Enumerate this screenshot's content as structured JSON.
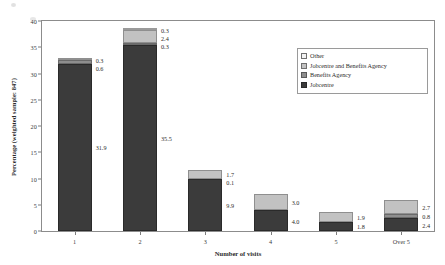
{
  "chart_data": {
    "type": "bar",
    "stacked": true,
    "title": "",
    "xlabel": "Number of visits",
    "ylabel": "Percentage (weighted sample: 847)",
    "categories": [
      "1",
      "2",
      "3",
      "4",
      "5",
      "Over 5"
    ],
    "ylim": [
      0,
      40
    ],
    "yticks": [
      0,
      5,
      10,
      15,
      20,
      25,
      30,
      35,
      40
    ],
    "grid": false,
    "legend_position": "upper-right-inside",
    "series": [
      {
        "name": "Jobcentre",
        "color": "#3b3b3b",
        "values": [
          31.9,
          35.5,
          9.9,
          4.0,
          1.8,
          2.4
        ],
        "labels": [
          "31.9",
          "35.5",
          "9.9",
          "4.0",
          "1.8",
          "2.4"
        ]
      },
      {
        "name": "Benefits Agency",
        "color": "#8e8e8e",
        "values": [
          0.6,
          0.3,
          0.1,
          0.0,
          0.0,
          0.8
        ],
        "labels": [
          "0.6",
          "0.3",
          "0.1",
          "",
          "",
          "0.8"
        ]
      },
      {
        "name": "Jobcentre and Benefits Agency",
        "color": "#c2c2c2",
        "values": [
          0.3,
          2.4,
          1.7,
          3.0,
          1.9,
          2.7
        ],
        "labels": [
          "0.3",
          "2.4",
          "1.7",
          "3.0",
          "1.9",
          "2.7"
        ]
      },
      {
        "name": "Other",
        "color": "#f2f2f2",
        "values": [
          0.0,
          0.3,
          0.0,
          0.0,
          0.0,
          0.0
        ],
        "labels": [
          "",
          "0.3",
          "",
          "",
          "",
          ""
        ]
      }
    ]
  },
  "legend": {
    "items": [
      {
        "label": "Other",
        "swatch": "s3"
      },
      {
        "label": "Jobcentre and Benefits Agency",
        "swatch": "s2"
      },
      {
        "label": "Benefits Agency",
        "swatch": "s1"
      },
      {
        "label": "Jobcentre",
        "swatch": "s0"
      }
    ]
  },
  "axes": {
    "x_title": "Number of visits",
    "y_title": "Percentage (weighted sample: 847)",
    "y_ticks": [
      "0",
      "5",
      "10",
      "15",
      "20",
      "25",
      "30",
      "35",
      "40"
    ],
    "x_ticks": [
      "1",
      "2",
      "3",
      "4",
      "5",
      "Over 5"
    ]
  }
}
